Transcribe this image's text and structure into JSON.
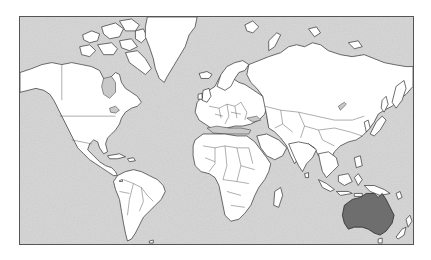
{
  "map": {
    "projection": "Mercator",
    "highlighted_region": "Australia",
    "colors": {
      "ocean": "#cbcbcb",
      "land": "#ffffff",
      "highlight": "#6e6e6e",
      "outline": "#2e2e2e",
      "frame": "#555555"
    },
    "regions": [
      {
        "name": "North America",
        "highlighted": false
      },
      {
        "name": "Greenland",
        "highlighted": false
      },
      {
        "name": "South America",
        "highlighted": false
      },
      {
        "name": "Europe",
        "highlighted": false
      },
      {
        "name": "Africa",
        "highlighted": false
      },
      {
        "name": "Asia",
        "highlighted": false
      },
      {
        "name": "Southeast Asia",
        "highlighted": false
      },
      {
        "name": "Australia",
        "highlighted": true
      },
      {
        "name": "New Zealand",
        "highlighted": false
      }
    ]
  }
}
